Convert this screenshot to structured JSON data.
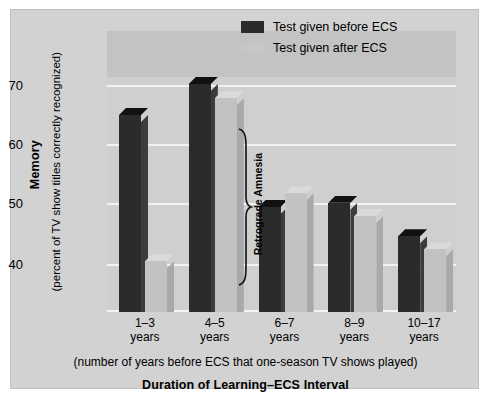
{
  "chart_data": {
    "type": "bar",
    "title": "",
    "xlabel": "Duration of Learning–ECS Interval",
    "xlabel_sub": "(number of years before ECS that one-season TV shows played)",
    "ylabel": "Memory",
    "ylabel_sub": "(percent of TV show titles correctly recognized)",
    "categories": [
      "1–3\nyears",
      "4–5\nyears",
      "6–7\nyears",
      "8–9\nyears",
      "10–17\nyears"
    ],
    "category_lines": [
      [
        "1–3",
        "years"
      ],
      [
        "4–5",
        "years"
      ],
      [
        "6–7",
        "years"
      ],
      [
        "8–9",
        "years"
      ],
      [
        "10–17",
        "years"
      ]
    ],
    "series": [
      {
        "name": "Test given before ECS",
        "color": "#2b2b2b",
        "values": [
          65.3,
          70.5,
          49.9,
          50.6,
          45.0
        ]
      },
      {
        "name": "Test given after ECS",
        "color": "#c2c2c2",
        "values": [
          40.8,
          68.1,
          52.2,
          48.4,
          42.8
        ]
      }
    ],
    "yticks": [
      40,
      50,
      60,
      70
    ],
    "ylim": [
      35,
      75
    ],
    "grid": true,
    "legend_position": "top-right",
    "annotations": [
      {
        "text": "Retrograde Amnesia",
        "type": "brace",
        "target": "1–3 years group"
      }
    ]
  },
  "legend": {
    "items": [
      {
        "label": "Test given before ECS",
        "swatch": "dark-swatch-icon"
      },
      {
        "label": "Test given after ECS",
        "swatch": "light-swatch-icon"
      }
    ]
  },
  "axis": {
    "y_title": "Memory",
    "y_subtitle": "(percent of TV show titles correctly recognized)",
    "y_ticks": [
      "70",
      "60",
      "50",
      "40"
    ],
    "x_subtitle": "(number of years before ECS that one-season TV shows played)",
    "x_title": "Duration of Learning–ECS Interval"
  },
  "annotation": {
    "label": "Retrograde Amnesia"
  },
  "colors": {
    "figure_background": "#d2d2d2",
    "plot_background": "#cfcfcf",
    "plot_band": "#c3c3c3",
    "gridline": "#f2f2f2",
    "series_before": "#2b2b2b",
    "series_after": "#c2c2c2"
  }
}
